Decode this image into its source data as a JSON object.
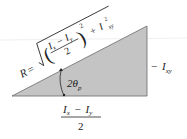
{
  "diagram": {
    "colors": {
      "fill": "#c4c4c4",
      "stroke": "#555555",
      "text": "#222222"
    },
    "hypotenuse_label": {
      "prefix": "R =",
      "numerator": "I",
      "sub_x": "x",
      "minus": "−",
      "numerator2": "I",
      "sub_y": "y",
      "denominator": "2",
      "exponent": "2",
      "plus": "+",
      "term": "I",
      "term_exp": "2",
      "term_sub": "xy"
    },
    "angle_label": {
      "text": "2θ",
      "sub": "p"
    },
    "vertical_side_label": {
      "minus": "−",
      "text": "I",
      "sub": "xy"
    },
    "base_label": {
      "numerator_a": "I",
      "sub_a": "x",
      "minus": "−",
      "numerator_b": "I",
      "sub_b": "y",
      "denominator": "2"
    }
  }
}
